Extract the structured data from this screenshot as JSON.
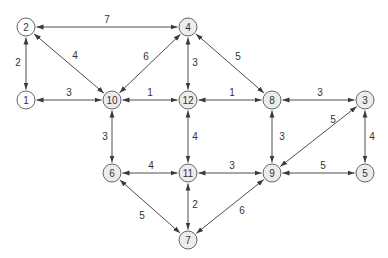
{
  "diagram": {
    "type": "weighted-bidirectional-graph",
    "colors": {
      "edge": "#3a3a3a",
      "node_stroke": "#555555",
      "node_fill_white": "#ffffff",
      "node_fill_gray": "#ececec",
      "text": "#333333"
    },
    "node_radius": 9,
    "nodes": [
      {
        "id": "1",
        "label": "1",
        "x": 26,
        "y": 100,
        "fill": "white"
      },
      {
        "id": "2",
        "label": "2",
        "x": 26,
        "y": 27,
        "fill": "white"
      },
      {
        "id": "3",
        "label": "3",
        "x": 365,
        "y": 100,
        "fill": "gray"
      },
      {
        "id": "4",
        "label": "4",
        "x": 188,
        "y": 27,
        "fill": "gray"
      },
      {
        "id": "5",
        "label": "5",
        "x": 365,
        "y": 173,
        "fill": "gray"
      },
      {
        "id": "6",
        "label": "6",
        "x": 112,
        "y": 173,
        "fill": "gray"
      },
      {
        "id": "7",
        "label": "7",
        "x": 188,
        "y": 240,
        "fill": "gray"
      },
      {
        "id": "8",
        "label": "8",
        "x": 272,
        "y": 100,
        "fill": "gray"
      },
      {
        "id": "9",
        "label": "9",
        "x": 272,
        "y": 173,
        "fill": "gray"
      },
      {
        "id": "10",
        "label": "10",
        "x": 112,
        "y": 100,
        "fill": "gray"
      },
      {
        "id": "11",
        "label": "11",
        "x": 188,
        "y": 173,
        "fill": "gray"
      },
      {
        "id": "12",
        "label": "12",
        "x": 188,
        "y": 100,
        "fill": "gray"
      }
    ],
    "edges": [
      {
        "from": "2",
        "to": "4",
        "weight": "7",
        "lx": 107,
        "ly": 20
      },
      {
        "from": "2",
        "to": "1",
        "weight": "2",
        "lx": 18,
        "ly": 63
      },
      {
        "from": "2",
        "to": "10",
        "weight": "4",
        "lx": 75,
        "ly": 56
      },
      {
        "from": "4",
        "to": "10",
        "weight": "6",
        "lx": 146,
        "ly": 57
      },
      {
        "from": "4",
        "to": "12",
        "weight": "3",
        "lx": 195,
        "ly": 63
      },
      {
        "from": "4",
        "to": "8",
        "weight": "5",
        "lx": 238,
        "ly": 57
      },
      {
        "from": "1",
        "to": "10",
        "weight": "3",
        "lx": 69,
        "ly": 93
      },
      {
        "from": "10",
        "to": "12",
        "weight": "1",
        "lx": 150,
        "ly": 93
      },
      {
        "from": "12",
        "to": "8",
        "weight": "1",
        "lx": 232,
        "ly": 93
      },
      {
        "from": "8",
        "to": "3",
        "weight": "3",
        "lx": 320,
        "ly": 93
      },
      {
        "from": "10",
        "to": "6",
        "weight": "3",
        "lx": 105,
        "ly": 137
      },
      {
        "from": "12",
        "to": "11",
        "weight": "4",
        "lx": 195,
        "ly": 137
      },
      {
        "from": "8",
        "to": "9",
        "weight": "3",
        "lx": 282,
        "ly": 137
      },
      {
        "from": "3",
        "to": "5",
        "weight": "4",
        "lx": 372,
        "ly": 137
      },
      {
        "from": "9",
        "to": "3",
        "weight": "5",
        "lx": 333,
        "ly": 120
      },
      {
        "from": "6",
        "to": "11",
        "weight": "4",
        "lx": 151,
        "ly": 166
      },
      {
        "from": "11",
        "to": "9",
        "weight": "3",
        "lx": 232,
        "ly": 166
      },
      {
        "from": "9",
        "to": "5",
        "weight": "5",
        "lx": 323,
        "ly": 166
      },
      {
        "from": "6",
        "to": "7",
        "weight": "5",
        "lx": 142,
        "ly": 216
      },
      {
        "from": "11",
        "to": "7",
        "weight": "2",
        "lx": 195,
        "ly": 205
      },
      {
        "from": "9",
        "to": "7",
        "weight": "6",
        "lx": 242,
        "ly": 211
      }
    ]
  }
}
